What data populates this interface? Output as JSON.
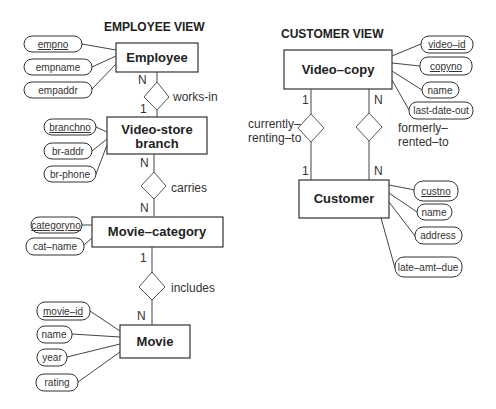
{
  "employee_view": {
    "title": "EMPLOYEE VIEW",
    "entities": {
      "employee": "Employee",
      "branch_line1": "Video-store",
      "branch_line2": "branch",
      "category": "Movie–category",
      "movie": "Movie"
    },
    "attributes": {
      "employee": [
        "empno",
        "empname",
        "empaddr"
      ],
      "branch": [
        "branchno",
        "br-addr",
        "br-phone"
      ],
      "category": [
        "categoryno",
        "cat–name"
      ],
      "movie": [
        "movie–id",
        "name",
        "year",
        "rating"
      ]
    },
    "relationships": {
      "works_in": "works-in",
      "carries": "carries",
      "includes": "includes"
    },
    "cardinalities": {
      "works_in_top": "N",
      "works_in_bottom": "1",
      "carries_top": "N",
      "carries_bottom": "N",
      "includes_top": "1",
      "includes_bottom": "N"
    }
  },
  "customer_view": {
    "title": "CUSTOMER VIEW",
    "entities": {
      "video_copy": "Video–copy",
      "customer": "Customer"
    },
    "attributes": {
      "video_copy": [
        "video–id",
        "copyno",
        "name",
        "last-date-out"
      ],
      "customer": [
        "custno",
        "name",
        "address",
        "late–amt–due"
      ]
    },
    "relationships": {
      "current_line1": "currently–",
      "current_line2": "renting–to",
      "former_line1": "formerly–",
      "former_line2": "rented–to"
    },
    "cardinalities": {
      "current_top": "1",
      "current_bottom": "1",
      "former_top": "N",
      "former_bottom": "N"
    }
  }
}
